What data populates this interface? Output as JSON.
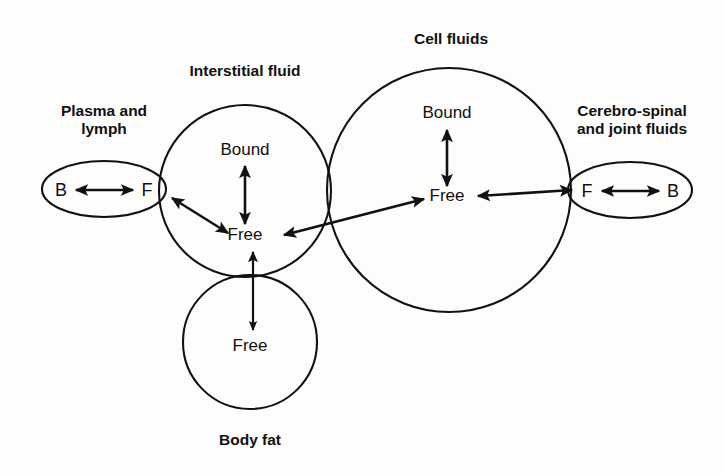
{
  "diagram": {
    "background_color": "#fdfdfc",
    "stroke_color": "#111111",
    "compartments": {
      "plasma": {
        "title_line1": "Plasma and",
        "title_line2": "lymph",
        "shape": "ellipse",
        "left_state": "B",
        "right_state": "F"
      },
      "interstitial": {
        "title": "Interstitial fluid",
        "shape": "circle",
        "upper_state": "Bound",
        "lower_state": "Free"
      },
      "cell": {
        "title": "Cell fluids",
        "shape": "circle",
        "upper_state": "Bound",
        "lower_state": "Free"
      },
      "csf": {
        "title_line1": "Cerebro-spinal",
        "title_line2": "and joint fluids",
        "shape": "ellipse",
        "left_state": "F",
        "right_state": "B"
      },
      "body_fat": {
        "title": "Body fat",
        "shape": "circle",
        "state": "Free"
      }
    },
    "connections": [
      {
        "name": "plasma-bound-free",
        "from": "B",
        "to": "F",
        "style": "double-headed"
      },
      {
        "name": "interstitial-bound-free",
        "from": "Bound",
        "to": "Free",
        "style": "double-headed"
      },
      {
        "name": "cell-bound-free",
        "from": "Bound",
        "to": "Free",
        "style": "double-headed"
      },
      {
        "name": "csf-free-bound",
        "from": "F",
        "to": "B",
        "style": "double-headed"
      },
      {
        "name": "plasma-to-interstitial",
        "from": "Plasma and lymph",
        "to": "Interstitial fluid",
        "style": "double-headed"
      },
      {
        "name": "interstitial-to-cell",
        "from": "Interstitial fluid",
        "to": "Cell fluids",
        "style": "double-headed"
      },
      {
        "name": "cell-to-csf",
        "from": "Cell fluids",
        "to": "Cerebro-spinal and joint fluids",
        "style": "double-headed"
      },
      {
        "name": "interstitial-to-body-fat",
        "from": "Interstitial fluid",
        "to": "Body fat",
        "style": "double-headed"
      }
    ]
  }
}
